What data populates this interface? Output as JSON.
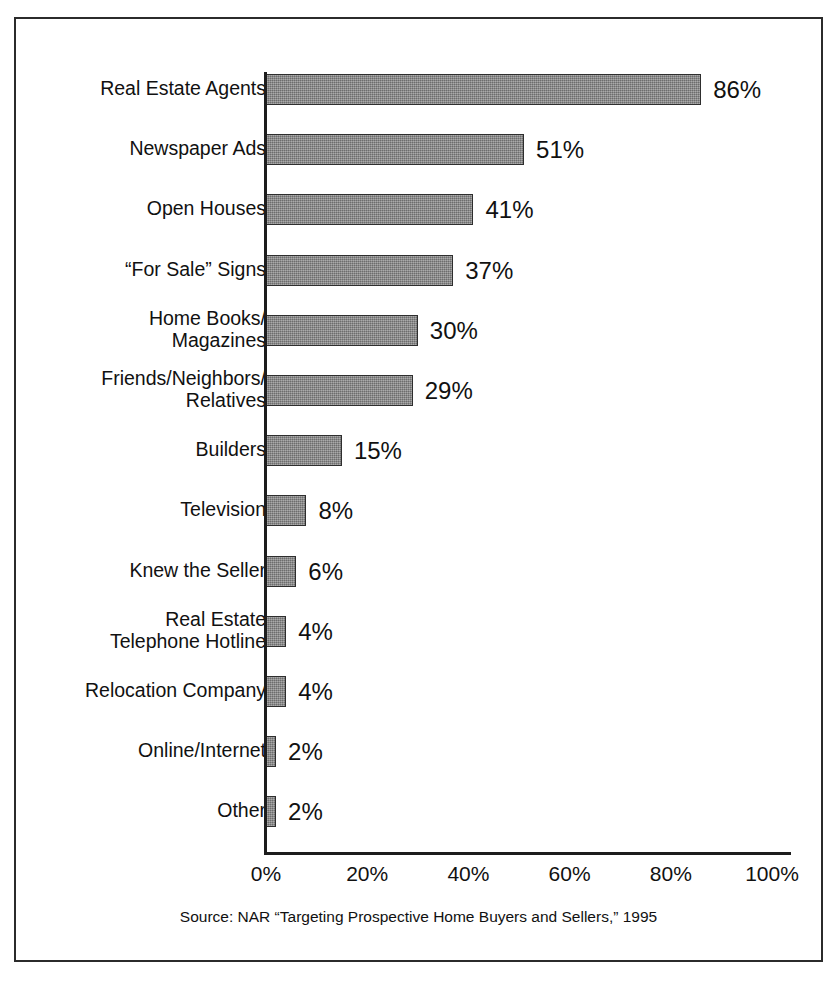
{
  "chart_title": "Sources Used in the Home Search p",
  "source_note": "Source: NAR “Targeting Prospective Home Buyers and Sellers,” 1995",
  "colors": {
    "bar_fill": "#878787",
    "bar_border": "#2e2e2e",
    "axis": "#1d1d1d",
    "frame": "#2b2b2b",
    "text": "#111111",
    "background": "#ffffff"
  },
  "chart_data": {
    "type": "bar",
    "orientation": "horizontal",
    "xlabel": "",
    "ylabel": "",
    "xlim": [
      0,
      100
    ],
    "grid": false,
    "legend": null,
    "value_suffix": "%",
    "categories": [
      "Real Estate Agents",
      "Newspaper Ads",
      "Open Houses",
      "“For Sale” Signs",
      "Home Books/\nMagazines",
      "Friends/Neighbors/\nRelatives",
      "Builders",
      "Television",
      "Knew the Seller",
      "Real Estate\nTelephone Hotline",
      "Relocation Company",
      "Online/Internet",
      "Other"
    ],
    "values": [
      86,
      51,
      41,
      37,
      30,
      29,
      15,
      8,
      6,
      4,
      4,
      2,
      2
    ],
    "value_labels": [
      "86%",
      "51%",
      "41%",
      "37%",
      "30%",
      "29%",
      "15%",
      "8%",
      "6%",
      "4%",
      "4%",
      "2%",
      "2%"
    ],
    "xticks": [
      0,
      20,
      40,
      60,
      80,
      100
    ],
    "xtick_labels": [
      "0%",
      "20%",
      "40%",
      "60%",
      "80%",
      "100%"
    ]
  }
}
